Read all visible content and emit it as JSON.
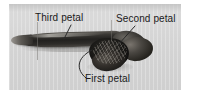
{
  "figure": {
    "type": "annotated-photograph",
    "plate_background_color": "#d9d9d9",
    "page_background_color": "#ffffff",
    "label_text_color": "#1a1a1a",
    "leader_line_color": "#2b2b2b"
  },
  "annotations": [
    {
      "id": "third-petal",
      "label": "Third petal",
      "leader": "short straight line angling down-left from the label to the upper surface of the long dark petal body"
    },
    {
      "id": "second-petal",
      "label": "Second petal",
      "leader": "straight line angling down-left from the label to the right-hand swollen lobe"
    },
    {
      "id": "first-petal",
      "label": "First petal",
      "leader": "curved line rising from the label up to the dense central cluster"
    }
  ],
  "scale_marks": [
    {
      "id": "tick-left",
      "orientation": "vertical"
    },
    {
      "id": "tick-right",
      "orientation": "vertical"
    }
  ]
}
